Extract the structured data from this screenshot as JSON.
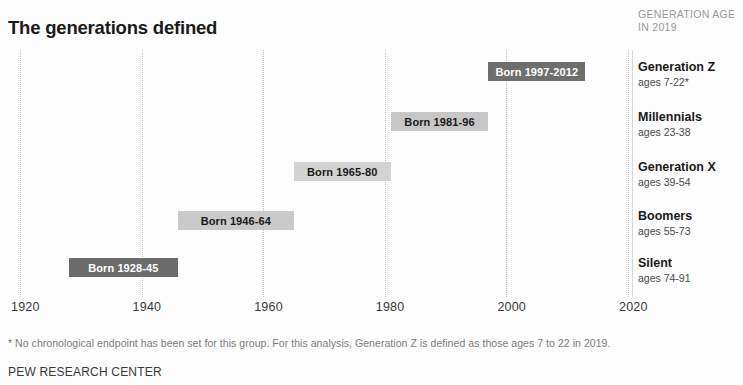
{
  "title": "The generations defined",
  "legend_header": "GENERATION AGE IN 2019",
  "legend_header_line1": "GENERATION AGE",
  "legend_header_line2": "IN 2019",
  "footnote": "* No chronological endpoint has been set for this group. For this analysis, Generation Z is defined as those ages 7 to 22 in 2019.",
  "source": "PEW RESEARCH CENTER",
  "legend": {
    "items": [
      {
        "name": "Generation Z",
        "ages": "ages 7-22*"
      },
      {
        "name": "Millennials",
        "ages": "ages 23-38"
      },
      {
        "name": "Generation X",
        "ages": "ages 39-54"
      },
      {
        "name": "Boomers",
        "ages": "ages 55-73"
      },
      {
        "name": "Silent",
        "ages": "ages 74-91"
      }
    ]
  },
  "chart_data": {
    "type": "bar",
    "orientation": "horizontal",
    "title": "The generations defined",
    "xlabel": "",
    "ylabel": "",
    "xlim": [
      1920,
      2020
    ],
    "grid": true,
    "legend_position": "right",
    "xticks": [
      1920,
      1940,
      1960,
      1980,
      2000,
      2020
    ],
    "xtick_labels": [
      "1920",
      "1940",
      "1960",
      "1980",
      "2000",
      "2020"
    ],
    "categories": [
      "Generation Z",
      "Millennials",
      "Generation X",
      "Boomers",
      "Silent"
    ],
    "bars": [
      {
        "category": "Generation Z",
        "label": "Born 1997-2012",
        "start": 1997,
        "end": 2012,
        "ages": "ages 7-22*",
        "fill": "#6e6e6e",
        "text_color": "#ffffff"
      },
      {
        "category": "Millennials",
        "label": "Born 1981-96",
        "start": 1981,
        "end": 1996,
        "ages": "ages 23-38",
        "fill": "#c6c6c6",
        "text_color": "#1a1a1a"
      },
      {
        "category": "Generation X",
        "label": "Born 1965-80",
        "start": 1965,
        "end": 1980,
        "ages": "ages 39-54",
        "fill": "#d3d3d3",
        "text_color": "#1a1a1a"
      },
      {
        "category": "Boomers",
        "label": "Born 1946-64",
        "start": 1946,
        "end": 1964,
        "ages": "ages 55-73",
        "fill": "#c9c9c9",
        "text_color": "#1a1a1a"
      },
      {
        "category": "Silent",
        "label": "Born 1928-45",
        "start": 1928,
        "end": 1945,
        "ages": "ages 74-91",
        "fill": "#6b6b6b",
        "text_color": "#ffffff"
      }
    ]
  }
}
